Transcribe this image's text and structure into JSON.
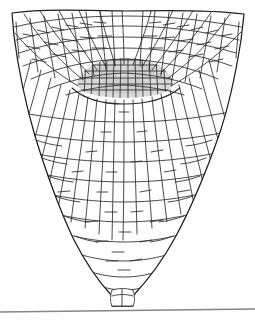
{
  "figure": {
    "kind": "scientific-line-drawing",
    "title": "",
    "caption": "",
    "background_color": "#ffffff",
    "stroke_color": "#2a2a2a",
    "outline_color": "#1e1e1e",
    "shade_color": "#dadada",
    "shade_color_deep": "#cfcfcf",
    "divider_color": "#868686",
    "width_px": 255,
    "height_px": 322
  },
  "regions": [
    {
      "id": "quiescent-center",
      "label": "",
      "description": "central lens-shaped shaded zone of small dense cells",
      "fill": "#dadada",
      "center_x": 124,
      "center_y": 78,
      "width": 92,
      "height": 30
    },
    {
      "id": "upper-fan",
      "label": "",
      "description": "radiating cell files fanning upward and outward from the center",
      "fill": "#ffffff"
    },
    {
      "id": "root-cap",
      "label": "",
      "description": "tapering columnar cap cells forming the V-shaped tip",
      "fill": "#ffffff"
    },
    {
      "id": "apex-knob",
      "label": "",
      "description": "small protruding cluster of cells at the extreme tip",
      "fill": "#ffffff",
      "center_x": 122,
      "center_y": 295
    }
  ],
  "divider": {
    "y_left": 312,
    "y_right": 309,
    "x_start": 0,
    "x_end": 255,
    "color": "#868686"
  }
}
